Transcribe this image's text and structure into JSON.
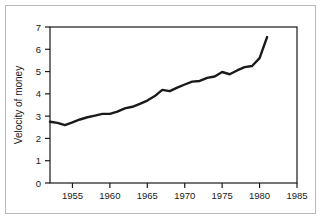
{
  "chart_data": {
    "type": "line",
    "title": "",
    "subtitle": "",
    "xlabel": "",
    "ylabel": "Velocity of money",
    "xlim": [
      1952,
      1985
    ],
    "ylim": [
      0,
      7
    ],
    "grid": false,
    "legend": null,
    "x_ticks": [
      1955,
      1960,
      1965,
      1970,
      1975,
      1980,
      1985
    ],
    "x_tick_labels": [
      "1955",
      "1960",
      "1965",
      "1970",
      "1975",
      "1980",
      "1985"
    ],
    "y_ticks": [
      0,
      1,
      2,
      3,
      4,
      5,
      6,
      7
    ],
    "y_tick_labels": [
      "0",
      "1",
      "2",
      "3",
      "4",
      "5",
      "6",
      "7"
    ],
    "series": [
      {
        "name": "Velocity of money",
        "color": "#1a1a1a",
        "line_width": 2.4,
        "x": [
          1952,
          1953,
          1954,
          1955,
          1956,
          1957,
          1958,
          1959,
          1960,
          1961,
          1962,
          1963,
          1964,
          1965,
          1966,
          1967,
          1968,
          1969,
          1970,
          1971,
          1972,
          1973,
          1974,
          1975,
          1976,
          1977,
          1978,
          1979,
          1980,
          1981
        ],
        "values": [
          2.75,
          2.7,
          2.6,
          2.72,
          2.85,
          2.95,
          3.02,
          3.1,
          3.1,
          3.2,
          3.35,
          3.42,
          3.55,
          3.7,
          3.9,
          4.18,
          4.12,
          4.28,
          4.42,
          4.55,
          4.58,
          4.72,
          4.78,
          4.98,
          4.88,
          5.05,
          5.2,
          5.25,
          5.6,
          6.55
        ]
      }
    ]
  },
  "axis": {
    "y_label": "Velocity of money"
  },
  "colors": {
    "line": "#1a1a1a",
    "axis": "#1a1a1a",
    "outer_border": "#b9b9b9",
    "background": "#ffffff"
  }
}
